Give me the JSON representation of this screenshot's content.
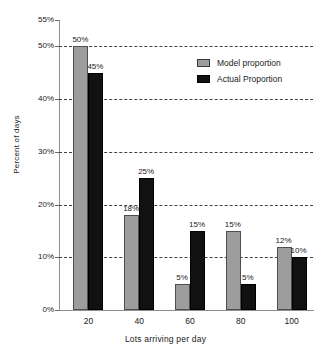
{
  "chart_data": {
    "type": "bar",
    "title": "",
    "xlabel": "Lots arriving per day",
    "ylabel": "Percent of days",
    "categories": [
      "20",
      "40",
      "60",
      "80",
      "100"
    ],
    "series": [
      {
        "name": "Model proportion",
        "color": "#9d9d9d",
        "values": [
          50,
          18,
          5,
          15,
          12
        ],
        "value_labels": [
          "50%",
          "18%",
          "5%",
          "15%",
          "12%"
        ]
      },
      {
        "name": "Actual Proportion",
        "color": "#111111",
        "values": [
          45,
          25,
          15,
          5,
          10
        ],
        "value_labels": [
          "45%",
          "25%",
          "15%",
          "5%",
          "10%"
        ]
      }
    ],
    "ylim": [
      0,
      55
    ],
    "yticks": [
      0,
      10,
      20,
      30,
      40,
      50,
      55
    ],
    "ytick_labels": [
      "0%",
      "10%",
      "20%",
      "30%",
      "40%",
      "50%",
      "55%"
    ],
    "gridlines_at": [
      10,
      20,
      30,
      40,
      50
    ],
    "grid": true,
    "grid_style": "dashed",
    "legend_position": "top-right"
  },
  "legend": {
    "items": [
      {
        "label": "Model proportion",
        "swatch": "model"
      },
      {
        "label": "Actual Proportion",
        "swatch": "actual"
      }
    ]
  },
  "axes": {
    "y_title": "Percent of days",
    "x_title": "Lots arriving per day"
  }
}
